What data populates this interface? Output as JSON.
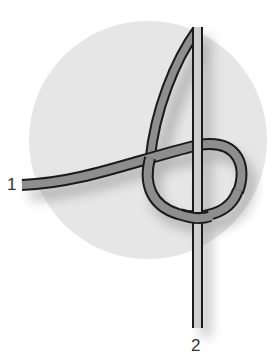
{
  "diagram": {
    "labels": {
      "end1": "1",
      "end2": "2"
    },
    "colors": {
      "background": "#ffffff",
      "circle": "#e6e6e6",
      "rope_light": "#cfcfcf",
      "rope_dark": "#8e8e8e",
      "outline": "#1a1a1a",
      "label": "#333333"
    }
  }
}
